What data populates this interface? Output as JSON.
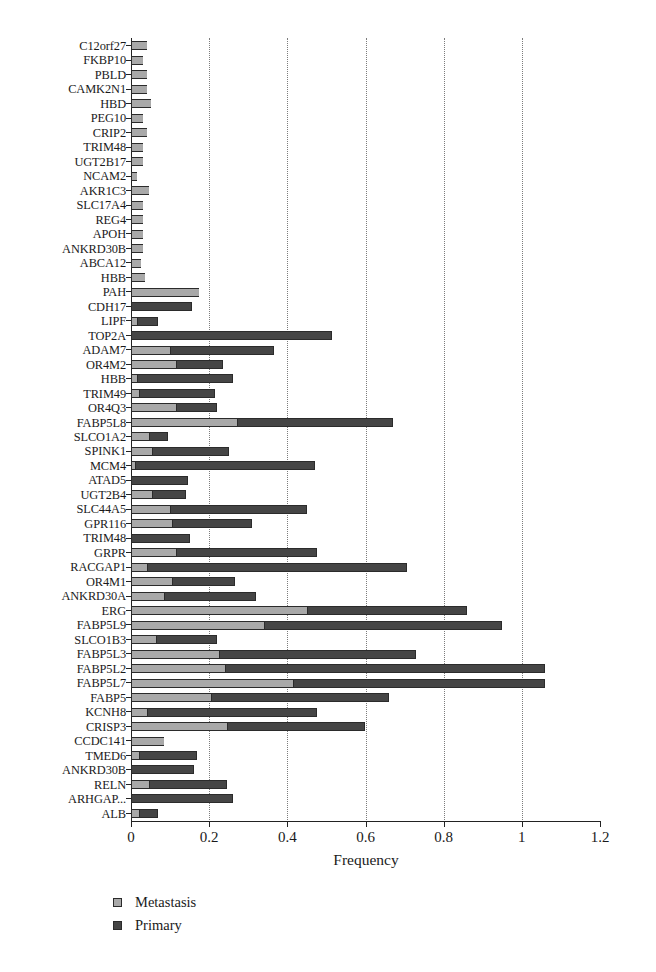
{
  "chart_data": {
    "type": "bar",
    "orientation": "horizontal",
    "stacked": true,
    "title": "",
    "xlabel": "Frequency",
    "ylabel": "",
    "xlim": [
      0,
      1.2
    ],
    "xticks": [
      0,
      0.2,
      0.4,
      0.6,
      0.8,
      1.0,
      1.2
    ],
    "xticklabels": [
      "0",
      "0.2",
      "0.4",
      "0.6",
      "0.8",
      "1",
      "1.2"
    ],
    "grid": "vertical-dotted",
    "legend_position": "bottom-left",
    "colors": {
      "metastasis": "#a9a9a9",
      "primary": "#454545",
      "edge": "#2b2b2b"
    },
    "legend": [
      {
        "name": "Metastasis",
        "color": "#a9a9a9"
      },
      {
        "name": "Primary",
        "color": "#454545"
      }
    ],
    "categories": [
      "C12orf27",
      "FKBP10",
      "PBLD",
      "CAMK2N1",
      "HBD",
      "PEG10",
      "CRIP2",
      "TRIM48",
      "UGT2B17",
      "NCAM2",
      "AKR1C3",
      "SLC17A4",
      "REG4",
      "APOH",
      "ANKRD30B",
      "ABCA12",
      "HBB",
      "PAH",
      "CDH17",
      "LIPF",
      "TOP2A",
      "ADAM7",
      "OR4M2",
      "HBB",
      "TRIM49",
      "OR4Q3",
      "FABP5L8",
      "SLCO1A2",
      "SPINK1",
      "MCM4",
      "ATAD5",
      "UGT2B4",
      "SLC44A5",
      "GPR116",
      "TRIM48",
      "GRPR",
      "RACGAP1",
      "OR4M1",
      "ANKRD30A",
      "ERG",
      "FABP5L9",
      "SLCO1B3",
      "FABP5L3",
      "FABP5L2",
      "FABP5L7",
      "FABP5",
      "KCNH8",
      "CRISP3",
      "CCDC141",
      "TMED6",
      "ANKRD30B",
      "RELN",
      "ARHGAP...",
      "ALB"
    ],
    "series": [
      {
        "name": "Metastasis",
        "values": [
          0.04,
          0.03,
          0.04,
          0.04,
          0.05,
          0.03,
          0.04,
          0.03,
          0.03,
          0.015,
          0.045,
          0.03,
          0.03,
          0.03,
          0.03,
          0.025,
          0.035,
          0.175,
          0.0,
          0.015,
          0.0,
          0.1,
          0.115,
          0.015,
          0.02,
          0.115,
          0.27,
          0.045,
          0.055,
          0.01,
          0.0,
          0.055,
          0.1,
          0.105,
          0.0,
          0.115,
          0.04,
          0.105,
          0.085,
          0.45,
          0.34,
          0.065,
          0.225,
          0.24,
          0.415,
          0.205,
          0.04,
          0.245,
          0.085,
          0.02,
          0.0,
          0.045,
          0.0,
          0.02
        ]
      },
      {
        "name": "Primary",
        "values": [
          0.0,
          0.0,
          0.0,
          0.0,
          0.0,
          0.0,
          0.0,
          0.0,
          0.0,
          0.0,
          0.0,
          0.0,
          0.0,
          0.0,
          0.0,
          0.0,
          0.0,
          0.0,
          0.155,
          0.055,
          0.515,
          0.265,
          0.12,
          0.245,
          0.195,
          0.105,
          0.4,
          0.05,
          0.195,
          0.46,
          0.145,
          0.085,
          0.35,
          0.205,
          0.15,
          0.36,
          0.665,
          0.16,
          0.235,
          0.41,
          0.61,
          0.155,
          0.505,
          0.82,
          0.645,
          0.455,
          0.435,
          0.355,
          0.0,
          0.15,
          0.16,
          0.2,
          0.26,
          0.05
        ]
      }
    ]
  }
}
